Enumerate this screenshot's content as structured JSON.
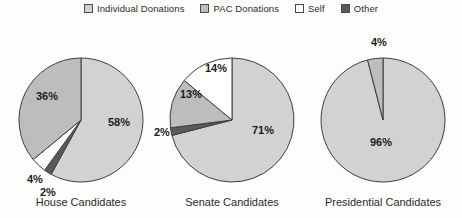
{
  "legend": {
    "items": [
      {
        "label": "Individual Donations",
        "key": "individual",
        "color": "#d2d2d2",
        "swatch": "legend-swatch-individual"
      },
      {
        "label": "PAC Donations",
        "key": "pac",
        "color": "#bdbdbd",
        "swatch": "legend-swatch-pac"
      },
      {
        "label": "Self",
        "key": "self",
        "color": "#ffffff",
        "swatch": "legend-swatch-self"
      },
      {
        "label": "Other",
        "key": "other",
        "color": "#5a5a5a",
        "swatch": "legend-swatch-other"
      }
    ]
  },
  "chart_data": {
    "type": "pie",
    "title": "",
    "legend_position": "top-center",
    "category_colors": {
      "Individual Donations": "#d2d2d2",
      "PAC Donations": "#bdbdbd",
      "Self": "#ffffff",
      "Other": "#5a5a5a"
    },
    "categories": [
      "Individual Donations",
      "PAC Donations",
      "Self",
      "Other"
    ],
    "units": "percent",
    "charts": [
      {
        "name": "House Candidates",
        "caption": "House Candidates",
        "cx": 81,
        "cy": 96,
        "r": 62,
        "start_angle_deg": 0,
        "slices": [
          {
            "category": "Individual Donations",
            "value": 58,
            "label": "58%",
            "color": "#d2d2d2",
            "label_x": 108,
            "label_y": 102
          },
          {
            "category": "Other",
            "value": 2,
            "label": "2%",
            "color": "#5a5a5a",
            "label_x": 40,
            "label_y": 172
          },
          {
            "category": "Self",
            "value": 4,
            "label": "4%",
            "color": "#ffffff",
            "label_x": 27,
            "label_y": 159
          },
          {
            "category": "PAC Donations",
            "value": 36,
            "label": "36%",
            "color": "#bdbdbd",
            "label_x": 36,
            "label_y": 76
          }
        ]
      },
      {
        "name": "Senate Candidates",
        "caption": "Senate Candidates",
        "cx": 232,
        "cy": 96,
        "r": 62,
        "start_angle_deg": 0,
        "slices": [
          {
            "category": "Individual Donations",
            "value": 71,
            "label": "71%",
            "color": "#d2d2d2",
            "label_x": 252,
            "label_y": 110
          },
          {
            "category": "Other",
            "value": 2,
            "label": "2%",
            "color": "#5a5a5a",
            "label_x": 154,
            "label_y": 112
          },
          {
            "category": "PAC Donations",
            "value": 13,
            "label": "13%",
            "color": "#bdbdbd",
            "label_x": 180,
            "label_y": 74
          },
          {
            "category": "Self",
            "value": 14,
            "label": "14%",
            "color": "#ffffff",
            "label_x": 205,
            "label_y": 48
          }
        ]
      },
      {
        "name": "Presidential Candidates",
        "caption": "Presidential Candidates",
        "cx": 383,
        "cy": 96,
        "r": 62,
        "start_angle_deg": 0,
        "slices": [
          {
            "category": "Individual Donations",
            "value": 96,
            "label": "96%",
            "color": "#d2d2d2",
            "label_x": 370,
            "label_y": 122
          },
          {
            "category": "PAC Donations",
            "value": 4,
            "label": "4%",
            "color": "#bdbdbd",
            "label_x": 371,
            "label_y": 22
          }
        ]
      }
    ],
    "captions": [
      {
        "text": "House Candidates",
        "x": 81,
        "y": 182
      },
      {
        "text": "Senate Candidates",
        "x": 232,
        "y": 182
      },
      {
        "text": "Presidential Candidates",
        "x": 383,
        "y": 182
      }
    ]
  }
}
